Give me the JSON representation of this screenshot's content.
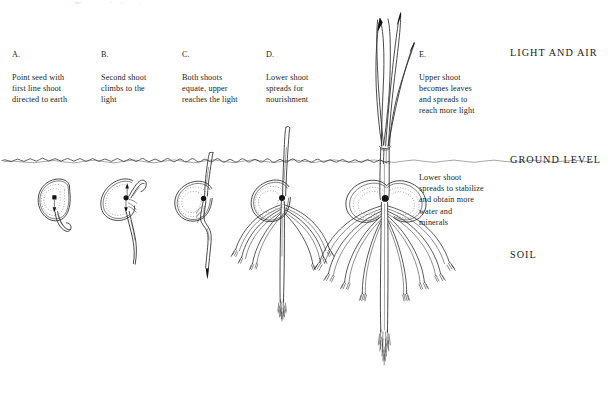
{
  "figure": {
    "background_color": "#ffffff",
    "ink_color": "#1b1b1b",
    "title_cut_off": "seedling germination stages",
    "stages": [
      {
        "key": "A",
        "letter": "A.",
        "text": "Point seed with\nfirst line shoot\ndirected to earth",
        "name": "stage-a"
      },
      {
        "key": "B",
        "letter": "B.",
        "text": "Second shoot\nclimbs to the\nlight",
        "name": "stage-b"
      },
      {
        "key": "C",
        "letter": "C.",
        "text": "Both shoots\nequate, upper\nreaches the light",
        "name": "stage-c"
      },
      {
        "key": "D",
        "letter": "D.",
        "text": "Lower shoot\nspreads for\nnourishment",
        "name": "stage-d"
      },
      {
        "key": "E",
        "letter": "E.",
        "text": "Upper shoot\nbecomes leaves\nand spreads to\nreach more light",
        "name": "stage-e"
      }
    ],
    "zone_labels": [
      {
        "text": "LIGHT AND AIR",
        "name": "zone-light-and-air"
      },
      {
        "text": "GROUND LEVEL",
        "name": "zone-ground-level"
      },
      {
        "text": "SOIL",
        "name": "zone-soil"
      }
    ],
    "notes": [
      {
        "text": "Lower shoot\nspreads to stabilize\nand obtain more\nwater and\nminerals",
        "name": "note-lower-shoot-spreads"
      }
    ]
  }
}
